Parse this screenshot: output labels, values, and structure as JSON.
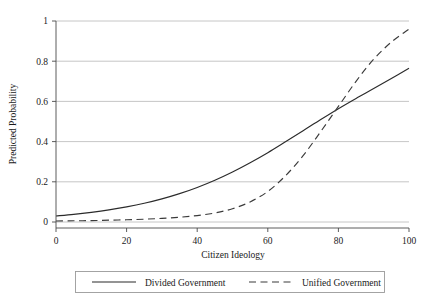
{
  "chart_data": {
    "type": "line",
    "title": "",
    "xlabel": "Citizen Ideology",
    "ylabel": "Predicted Probability",
    "xlim": [
      0,
      100
    ],
    "ylim": [
      0,
      1
    ],
    "xticks": [
      "0",
      "20",
      "40",
      "60",
      "80",
      "100"
    ],
    "xtick_values": [
      0,
      20,
      40,
      60,
      80,
      100
    ],
    "yticks": [
      "0",
      "0.2",
      "0.4",
      "0.6",
      "0.8",
      "1"
    ],
    "ytick_values": [
      0,
      0.2,
      0.4,
      0.6,
      0.8,
      1
    ],
    "grid": "horizontal",
    "legend_position": "bottom",
    "x": [
      0,
      5,
      10,
      15,
      20,
      25,
      30,
      35,
      40,
      45,
      50,
      55,
      60,
      65,
      70,
      75,
      80,
      85,
      90,
      95,
      100
    ],
    "series": [
      {
        "name": "Divided Government",
        "style": "solid",
        "color": "#2b2b2b",
        "values": [
          0.03,
          0.038,
          0.048,
          0.06,
          0.075,
          0.093,
          0.115,
          0.141,
          0.172,
          0.208,
          0.249,
          0.295,
          0.345,
          0.399,
          0.454,
          0.51,
          0.564,
          0.615,
          0.664,
          0.714,
          0.765
        ]
      },
      {
        "name": "Unified Government",
        "style": "dashed",
        "color": "#3a3a3a",
        "values": [
          0.005,
          0.006,
          0.007,
          0.009,
          0.011,
          0.014,
          0.018,
          0.024,
          0.032,
          0.045,
          0.066,
          0.1,
          0.152,
          0.23,
          0.33,
          0.45,
          0.575,
          0.7,
          0.81,
          0.895,
          0.96
        ]
      }
    ]
  },
  "legend": {
    "entries": [
      {
        "label": "Divided Government",
        "style": "solid"
      },
      {
        "label": "Unified Government",
        "style": "dashed"
      }
    ]
  }
}
